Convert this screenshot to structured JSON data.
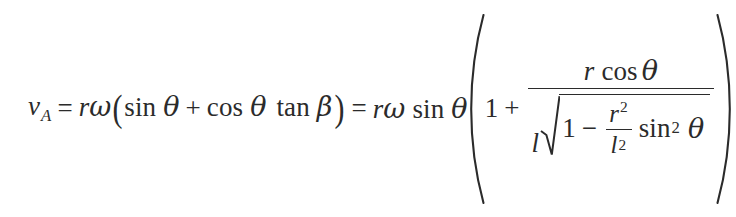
{
  "document": {
    "kind": "mathematical-equation",
    "background_color": "#ffffff",
    "text_color": "#2b2b2b"
  },
  "equation": {
    "plain_text": "v_A = r*omega*(sin theta + cos theta tan beta) = r*omega*sin theta * (1 + (r cos theta)/(l*sqrt(1 - (r^2/l^2) sin^2 theta)))",
    "lhs": {
      "variable": "v",
      "subscript": "A"
    },
    "relation_1": "=",
    "middle": {
      "factor_r": "r",
      "factor_omega": "ω",
      "paren_open": "(",
      "term_1_fn": "sin",
      "term_1_arg": "θ",
      "plus": "+",
      "term_2_fn": "cos",
      "term_2_arg": "θ",
      "term_3_fn": "tan",
      "term_3_arg": "β",
      "paren_close": ")"
    },
    "relation_2": "=",
    "rhs": {
      "factor_r": "r",
      "factor_omega": "ω",
      "sin_fn": "sin",
      "sin_arg": "θ",
      "bracket_open": "(",
      "bracket_close": ")",
      "one": "1",
      "plus": "+",
      "fraction": {
        "numerator": {
          "factor_r": "r",
          "cos_fn": "cos",
          "cos_arg": "θ"
        },
        "denominator": {
          "leading_l": "l",
          "radical_symbol": "√",
          "one": "1",
          "minus": "−",
          "inner_fraction": {
            "numerator_base": "r",
            "numerator_exponent": "2",
            "denominator_base": "l",
            "denominator_exponent": "2"
          },
          "sin_fn": "sin",
          "sin_exponent": "2",
          "sin_arg": "θ"
        }
      }
    }
  }
}
